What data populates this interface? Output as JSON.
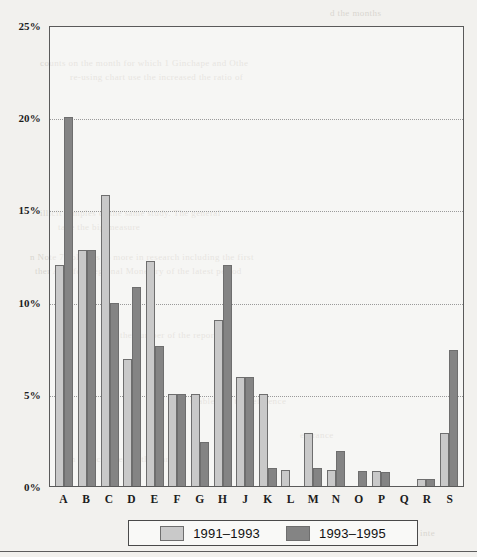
{
  "chart_data": {
    "type": "bar",
    "title": "",
    "xlabel": "",
    "ylabel": "",
    "ylim": [
      0,
      25
    ],
    "yticks": [
      "0%",
      "5%",
      "10%",
      "15%",
      "20%",
      "25%"
    ],
    "ytick_values": [
      0,
      5,
      10,
      15,
      20,
      25
    ],
    "grid": true,
    "legend_position": "bottom",
    "categories": [
      "A",
      "B",
      "C",
      "D",
      "E",
      "F",
      "G",
      "H",
      "J",
      "K",
      "L",
      "M",
      "N",
      "O",
      "P",
      "Q",
      "R",
      "S"
    ],
    "series": [
      {
        "name": "1991–1993",
        "color": "#c9c9c9",
        "values": [
          12.0,
          12.8,
          15.8,
          6.9,
          12.2,
          5.0,
          5.0,
          9.0,
          5.9,
          5.0,
          0.85,
          2.9,
          0.85,
          0.0,
          0.8,
          0.0,
          0.4,
          2.9
        ]
      },
      {
        "name": "1993–1995",
        "color": "#848484",
        "values": [
          20.0,
          12.8,
          9.9,
          10.8,
          7.6,
          5.0,
          2.4,
          12.0,
          5.9,
          1.0,
          0.0,
          1.0,
          1.9,
          0.8,
          0.75,
          0.0,
          0.4,
          7.4
        ]
      }
    ]
  },
  "legend": {
    "items": [
      {
        "label": "1991–1993",
        "color": "#c9c9c9"
      },
      {
        "label": "1993–1995",
        "color": "#848484"
      }
    ]
  },
  "page": {
    "bleed_lines": [
      {
        "text": "d the months",
        "x": 330,
        "y": 8
      },
      {
        "text": "counts on the month for which 1 Ginchape and Othe",
        "x": 40,
        "y": 58
      },
      {
        "text": "re-using chart use the increased the ratio of",
        "x": 70,
        "y": 72
      },
      {
        "text": "illicit samples of the same study. The general",
        "x": 40,
        "y": 208
      },
      {
        "text": "take the big measure",
        "x": 58,
        "y": 222
      },
      {
        "text": "n Note 7 columns to more in research including the first",
        "x": 30,
        "y": 252
      },
      {
        "text": "ther A.S. for Regional Monetary of the latest period",
        "x": 35,
        "y": 266
      },
      {
        "text": "the number of the reporting",
        "x": 120,
        "y": 330
      },
      {
        "text": "urable and the reference",
        "x": 190,
        "y": 396
      },
      {
        "text": "entrance",
        "x": 300,
        "y": 430
      },
      {
        "text": "tion to recovered of the parties",
        "x": 60,
        "y": 454
      },
      {
        "text": "inte",
        "x": 420,
        "y": 528
      }
    ]
  }
}
